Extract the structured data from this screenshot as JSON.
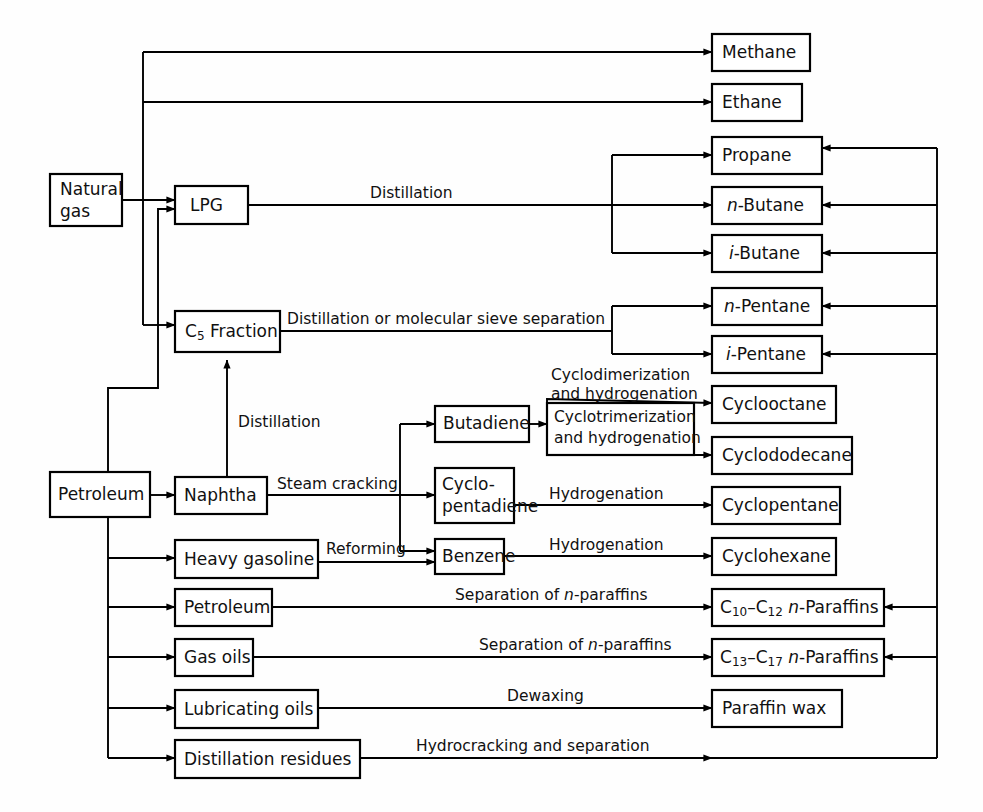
{
  "diagram": {
    "background_color": "#fefefe",
    "line_color": "#000000",
    "box_fill": "#ffffff"
  },
  "nodes": {
    "natural_gas": "Natural\ngas",
    "natural_gas_line1": "Natural",
    "natural_gas_line2": "gas",
    "lpg": "LPG",
    "c5_fraction_pre": "C",
    "c5_fraction_sub": "5",
    "c5_fraction_post": " Fraction",
    "petroleum_main": "Petroleum",
    "naphtha": "Naphtha",
    "heavy_gasoline": "Heavy gasoline",
    "petroleum_cut": "Petroleum",
    "gas_oils": "Gas oils",
    "lubricating_oils": "Lubricating oils",
    "distillation_residues": "Distillation residues",
    "butadiene": "Butadiene",
    "cyclopentadiene_line1": "Cyclo-",
    "cyclopentadiene_line2": "pentadiene",
    "benzene": "Benzene",
    "cyclotrimerization_line1": "Cyclotrimerization",
    "cyclotrimerization_line2": "and hydrogenation",
    "methane": "Methane",
    "ethane": "Ethane",
    "propane": "Propane",
    "n_butane_pre": "n",
    "n_butane_post": "-Butane",
    "i_butane_pre": "i",
    "i_butane_post": "-Butane",
    "n_pentane_pre": "n",
    "n_pentane_post": "-Pentane",
    "i_pentane_pre": "i",
    "i_pentane_post": "-Pentane",
    "cyclooctane": "Cyclooctane",
    "cyclododecane": "Cyclododecane",
    "cyclopentane": "Cyclopentane",
    "cyclohexane": "Cyclohexane",
    "c10_c12_paraffins_c": "C",
    "c10_c12_paraffins_s1": "10",
    "c10_c12_paraffins_d": "–C",
    "c10_c12_paraffins_s2": "12",
    "c10_c12_paraffins_n": " n",
    "c10_c12_paraffins_tail": "-Paraffins",
    "c13_c17_paraffins_c": "C",
    "c13_c17_paraffins_s1": "13",
    "c13_c17_paraffins_d": "–C",
    "c13_c17_paraffins_s2": "17",
    "c13_c17_paraffins_n": " n",
    "c13_c17_paraffins_tail": "-Paraffins",
    "paraffin_wax": "Paraffin wax"
  },
  "edge_labels": {
    "distillation_lpg": "Distillation",
    "distillation_or_molecular_sieve": "Distillation or molecular sieve separation",
    "distillation_naphtha_to_c5": "Distillation",
    "steam_cracking": "Steam cracking",
    "reforming": "Reforming",
    "cyclodimerization_line1": "Cyclodimerization",
    "cyclodimerization_line2": "and hydrogenation",
    "hydrogenation_cyclopentane": "Hydrogenation",
    "hydrogenation_cyclohexane": "Hydrogenation",
    "separation_n_paraffins_1_pre": "Separation of ",
    "separation_n_paraffins_1_ital": "n",
    "separation_n_paraffins_1_post": "-paraffins",
    "separation_n_paraffins_2_pre": "Separation of ",
    "separation_n_paraffins_2_ital": "n",
    "separation_n_paraffins_2_post": "-paraffins",
    "dewaxing": "Dewaxing",
    "hydrocracking_and_separation": "Hydrocracking and separation"
  }
}
